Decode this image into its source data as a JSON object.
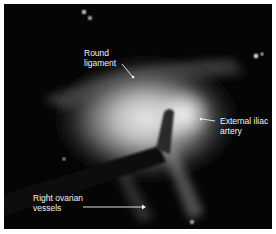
{
  "figure": {
    "type": "laparoscopic-photograph",
    "colors": {
      "border": "#ffffff",
      "background": "#050505",
      "label": "#f2f2f2"
    },
    "labels": [
      {
        "id": "round-ligament",
        "line1": "Round",
        "line2": "ligament"
      },
      {
        "id": "external-iliac-artery",
        "line1": "External iliac",
        "line2": "artery"
      },
      {
        "id": "right-ovarian-vessels",
        "line1": "Right ovarian",
        "line2": "vessels"
      }
    ]
  }
}
